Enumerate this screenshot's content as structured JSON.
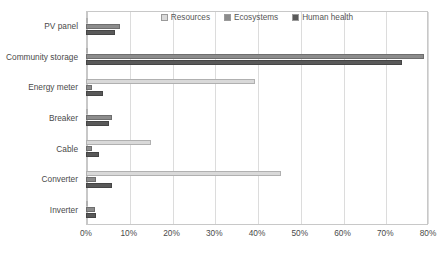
{
  "chart_data": {
    "type": "bar",
    "orientation": "horizontal",
    "title": "",
    "xlabel": "",
    "ylabel": "",
    "xlim": [
      0,
      80
    ],
    "xtick_labels": [
      "0%",
      "10%",
      "20%",
      "30%",
      "40%",
      "50%",
      "60%",
      "70%",
      "80%"
    ],
    "xtick_values": [
      0,
      10,
      20,
      30,
      40,
      50,
      60,
      70,
      80
    ],
    "grid": true,
    "legend_position": "top-center",
    "categories": [
      "PV panel",
      "Community storage",
      "Energy meter",
      "Breaker",
      "Cable",
      "Converter",
      "Inverter"
    ],
    "series": [
      {
        "name": "Resources",
        "color": "#d9d9d9",
        "values": [
          0.4,
          0.3,
          39.5,
          0.4,
          15.2,
          45.5,
          0.4
        ]
      },
      {
        "name": "Ecosystems",
        "color": "#8c8c8c",
        "values": [
          8.0,
          79.0,
          1.5,
          6.0,
          1.3,
          2.3,
          2.2
        ]
      },
      {
        "name": "Human health",
        "color": "#595959",
        "values": [
          6.8,
          74.0,
          4.0,
          5.3,
          3.0,
          6.0,
          2.3
        ]
      }
    ]
  },
  "legend": {
    "items": [
      {
        "label": "Resources"
      },
      {
        "label": "Ecosystems"
      },
      {
        "label": "Human health"
      }
    ]
  }
}
